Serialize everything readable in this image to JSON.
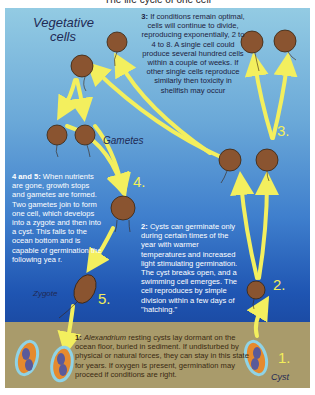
{
  "title": "The life cycle of one cell",
  "colors": {
    "sky_top": "#93cbe3",
    "sky_bottom": "#1b4aa3",
    "sediment": "#a99b6b",
    "arrow": "#f3ef5e",
    "cell": "#8a5430",
    "cyst_outline": "#8fd3e6",
    "cyst_fill": "#e58a2e"
  },
  "labels": {
    "vegetative_1": "Vegetative",
    "vegetative_2": "cells",
    "gametes": "Gametes",
    "zygote": "Zygote",
    "cyst": "Cyst"
  },
  "steps": {
    "s1": "1.",
    "s2": "2.",
    "s3": "3.",
    "s4": "4.",
    "s5": "5."
  },
  "texts": {
    "step3_head": "3:",
    "step3_body": "If conditions remain optimal, cells will continue to divide, reproducing exponentially, 2 to 4 to 8. A single cell could produce several hundred cells within a couple of weeks. If other single cells reproduce similarly then toxicity in shellfish may occur",
    "step45_head": "4 and 5:",
    "step45_body": "When nutrients are gone, growth stops and gametes are formed. Two gametes join to form one cell, which develops into a zygote and then into a cyst. This falls to the ocean bottom and is capable of germination the following yea r.",
    "step2_head": "2:",
    "step2_body": "Cysts can germinate only during certain times of the year with warmer temperatures and increased light stimulating germination. The cyst breaks open, and a swimming cell emerges. The cell reproduces by simple division within a few days of \"hatching.\"",
    "step1_head": "1:",
    "step1_italic": "Alexandrium",
    "step1_body": "resting cysts lay dormant on the ocean floor, buried in sediment. If undisturbed by physical or natural forces, they can stay in this state for years. If oxygen is present, germination may proceed if conditions are right."
  }
}
